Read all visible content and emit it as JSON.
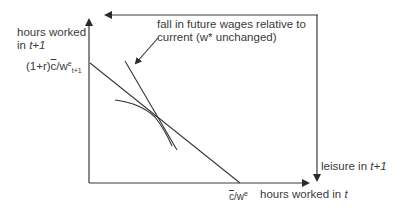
{
  "diagram": {
    "type": "intertemporal labor supply diagram",
    "y_axis_label": {
      "text": "hours worked",
      "line2_prefix": "in ",
      "line2_italic": "t+1"
    },
    "x_axis_label": {
      "text": "hours worked in ",
      "italic": "t"
    },
    "right_axis_label": {
      "text": "leisure in ",
      "italic": "t+1"
    },
    "y_intercept_label": {
      "prefix": "(1+r)",
      "c": "c",
      "mid": "/w",
      "sup": "e",
      "sub": "t+1"
    },
    "x_intercept_label": {
      "c": "c",
      "mid": "/w",
      "sup": "e"
    },
    "annotation": {
      "line1": "fall in future wages relative to",
      "line2": "current (w* unchanged)"
    },
    "colors": {
      "ink": "#333333",
      "background": "#ffffff"
    }
  }
}
